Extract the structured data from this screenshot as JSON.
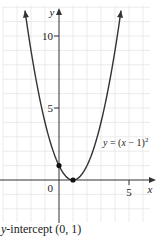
{
  "chart_data": {
    "type": "line",
    "title": "",
    "function": "y = (x - 1)^2",
    "curve_label": "y = (x − 1)²",
    "xlabel": "x",
    "ylabel": "y",
    "x_ticks": [
      {
        "value": 5,
        "label": "5"
      }
    ],
    "y_ticks": [
      {
        "value": 5,
        "label": "5"
      },
      {
        "value": 10,
        "label": "10"
      }
    ],
    "origin_label": "0",
    "xlim": [
      -4.2,
      6.9
    ],
    "ylim": [
      -3,
      12
    ],
    "grid": true,
    "grid_step": 1,
    "series": [
      {
        "name": "y = (x − 1)²",
        "x_range": [
          -2.43,
          4.43
        ],
        "points": [
          {
            "x": -2.43,
            "y": 11.8
          },
          {
            "x": -2,
            "y": 9
          },
          {
            "x": -1,
            "y": 4
          },
          {
            "x": 0,
            "y": 1
          },
          {
            "x": 1,
            "y": 0
          },
          {
            "x": 2,
            "y": 1
          },
          {
            "x": 3,
            "y": 4
          },
          {
            "x": 4,
            "y": 9
          },
          {
            "x": 4.43,
            "y": 11.8
          }
        ],
        "arrows_at_ends": true
      }
    ],
    "marked_points": [
      {
        "x": 0,
        "y": 1,
        "role": "y-intercept"
      },
      {
        "x": 1,
        "y": 0,
        "role": "vertex"
      }
    ],
    "annotations": [
      {
        "text": "y-intercept (0, 1)",
        "position": "below-left"
      }
    ]
  },
  "figure": {
    "caption_var": "y",
    "caption_rest": "-intercept (0, 1)",
    "colors": {
      "curve": "#333333",
      "axis": "#333333",
      "grid": "#e6e6e6",
      "points": "#111111",
      "text": "#222222"
    }
  }
}
